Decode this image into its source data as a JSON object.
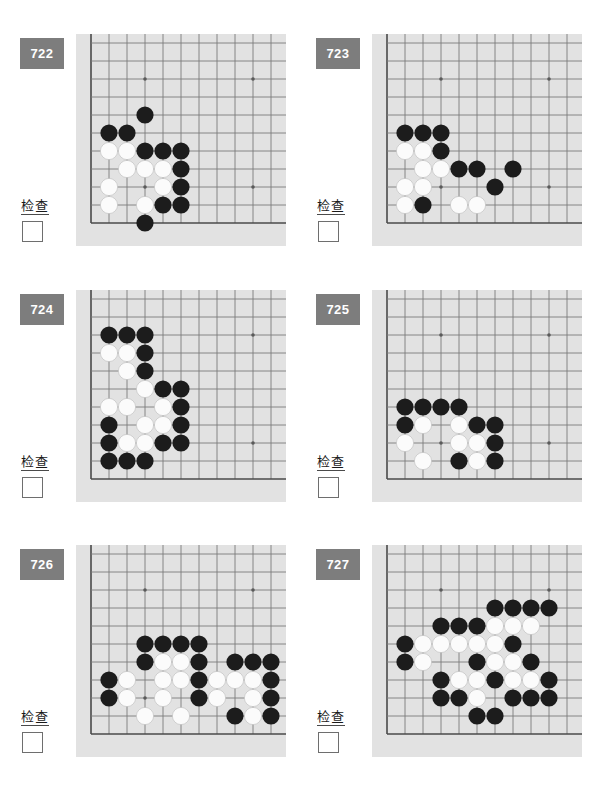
{
  "page": {
    "background": "#ffffff",
    "board_background": "#e2e2e2",
    "badge_color": "#7d7d7d",
    "badge_text_color": "#ffffff",
    "grid_line_color": "#7a7a7a",
    "edge_line_color": "#4a4a4a",
    "black_stone_color": "#1c1c1c",
    "white_stone_color": "#fbfbfb",
    "check_label": "检查",
    "columns": 2,
    "rows": 3
  },
  "board_geometry": {
    "cols": 11,
    "rows": 11,
    "cell": 18,
    "origin_x": 15,
    "origin_y": 9,
    "stone_radius": 8.6,
    "star_points": [
      [
        3,
        2
      ],
      [
        9,
        2
      ],
      [
        3,
        8
      ],
      [
        9,
        8
      ]
    ],
    "right_edge_open": true,
    "top_edge_open": true,
    "note": "Corner position: left edge is column 0, bottom edge is row 10"
  },
  "problems": [
    {
      "number": "722",
      "check_label": "检查",
      "black": [
        [
          3,
          4
        ],
        [
          1,
          5
        ],
        [
          2,
          5
        ],
        [
          3,
          6
        ],
        [
          4,
          6
        ],
        [
          5,
          6
        ],
        [
          5,
          7
        ],
        [
          5,
          8
        ],
        [
          4,
          9
        ],
        [
          5,
          9
        ],
        [
          3,
          10
        ]
      ],
      "white": [
        [
          1,
          6
        ],
        [
          2,
          6
        ],
        [
          2,
          7
        ],
        [
          3,
          7
        ],
        [
          4,
          7
        ],
        [
          1,
          8
        ],
        [
          4,
          8
        ],
        [
          1,
          9
        ],
        [
          3,
          9
        ]
      ]
    },
    {
      "number": "723",
      "check_label": "检查",
      "black": [
        [
          1,
          5
        ],
        [
          2,
          5
        ],
        [
          3,
          5
        ],
        [
          3,
          6
        ],
        [
          4,
          7
        ],
        [
          5,
          7
        ],
        [
          7,
          7
        ],
        [
          6,
          8
        ],
        [
          2,
          9
        ]
      ],
      "white": [
        [
          1,
          6
        ],
        [
          2,
          6
        ],
        [
          2,
          7
        ],
        [
          3,
          7
        ],
        [
          1,
          8
        ],
        [
          2,
          8
        ],
        [
          1,
          9
        ],
        [
          4,
          9
        ],
        [
          5,
          9
        ]
      ]
    },
    {
      "number": "724",
      "check_label": "检查",
      "black": [
        [
          1,
          2
        ],
        [
          2,
          2
        ],
        [
          3,
          2
        ],
        [
          3,
          3
        ],
        [
          3,
          4
        ],
        [
          4,
          5
        ],
        [
          5,
          5
        ],
        [
          5,
          6
        ],
        [
          1,
          7
        ],
        [
          5,
          7
        ],
        [
          1,
          8
        ],
        [
          4,
          8
        ],
        [
          5,
          8
        ],
        [
          1,
          9
        ],
        [
          2,
          9
        ],
        [
          3,
          9
        ]
      ],
      "white": [
        [
          1,
          3
        ],
        [
          2,
          3
        ],
        [
          2,
          4
        ],
        [
          3,
          5
        ],
        [
          1,
          6
        ],
        [
          2,
          6
        ],
        [
          4,
          6
        ],
        [
          3,
          7
        ],
        [
          4,
          7
        ],
        [
          2,
          8
        ],
        [
          3,
          8
        ]
      ]
    },
    {
      "number": "725",
      "check_label": "检查",
      "black": [
        [
          1,
          6
        ],
        [
          2,
          6
        ],
        [
          3,
          6
        ],
        [
          4,
          6
        ],
        [
          1,
          7
        ],
        [
          5,
          7
        ],
        [
          6,
          7
        ],
        [
          6,
          8
        ],
        [
          4,
          9
        ],
        [
          6,
          9
        ]
      ],
      "white": [
        [
          2,
          7
        ],
        [
          4,
          7
        ],
        [
          1,
          8
        ],
        [
          4,
          8
        ],
        [
          5,
          8
        ],
        [
          2,
          9
        ],
        [
          5,
          9
        ]
      ]
    },
    {
      "number": "726",
      "check_label": "检查",
      "black": [
        [
          3,
          5
        ],
        [
          4,
          5
        ],
        [
          5,
          5
        ],
        [
          6,
          5
        ],
        [
          3,
          6
        ],
        [
          6,
          6
        ],
        [
          8,
          6
        ],
        [
          9,
          6
        ],
        [
          10,
          6
        ],
        [
          1,
          7
        ],
        [
          6,
          7
        ],
        [
          10,
          7
        ],
        [
          1,
          8
        ],
        [
          6,
          8
        ],
        [
          10,
          8
        ],
        [
          8,
          9
        ],
        [
          10,
          9
        ]
      ],
      "white": [
        [
          4,
          6
        ],
        [
          5,
          6
        ],
        [
          2,
          7
        ],
        [
          4,
          7
        ],
        [
          5,
          7
        ],
        [
          7,
          7
        ],
        [
          8,
          7
        ],
        [
          9,
          7
        ],
        [
          2,
          8
        ],
        [
          4,
          8
        ],
        [
          7,
          8
        ],
        [
          9,
          8
        ],
        [
          3,
          9
        ],
        [
          5,
          9
        ],
        [
          9,
          9
        ]
      ]
    },
    {
      "number": "727",
      "check_label": "检查",
      "black": [
        [
          6,
          3
        ],
        [
          7,
          3
        ],
        [
          8,
          3
        ],
        [
          9,
          3
        ],
        [
          3,
          4
        ],
        [
          4,
          4
        ],
        [
          5,
          4
        ],
        [
          1,
          5
        ],
        [
          7,
          5
        ],
        [
          1,
          6
        ],
        [
          5,
          6
        ],
        [
          8,
          6
        ],
        [
          3,
          7
        ],
        [
          6,
          7
        ],
        [
          9,
          7
        ],
        [
          3,
          8
        ],
        [
          4,
          8
        ],
        [
          7,
          8
        ],
        [
          8,
          8
        ],
        [
          9,
          8
        ],
        [
          5,
          9
        ],
        [
          6,
          9
        ]
      ],
      "white": [
        [
          6,
          4
        ],
        [
          7,
          4
        ],
        [
          8,
          4
        ],
        [
          2,
          5
        ],
        [
          3,
          5
        ],
        [
          4,
          5
        ],
        [
          5,
          5
        ],
        [
          6,
          5
        ],
        [
          2,
          6
        ],
        [
          6,
          6
        ],
        [
          7,
          6
        ],
        [
          4,
          7
        ],
        [
          5,
          7
        ],
        [
          7,
          7
        ],
        [
          8,
          7
        ],
        [
          5,
          8
        ]
      ]
    }
  ]
}
